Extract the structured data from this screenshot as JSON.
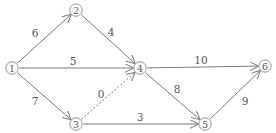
{
  "diagram": {
    "type": "directed-weighted-network",
    "nodes": [
      {
        "id": "1",
        "label": "1",
        "x": 12,
        "y": 68
      },
      {
        "id": "2",
        "label": "2",
        "x": 76,
        "y": 10
      },
      {
        "id": "3",
        "label": "3",
        "x": 76,
        "y": 124
      },
      {
        "id": "4",
        "label": "4",
        "x": 140,
        "y": 68
      },
      {
        "id": "5",
        "label": "5",
        "x": 205,
        "y": 124
      },
      {
        "id": "6",
        "label": "6",
        "x": 265,
        "y": 66
      }
    ],
    "edges": [
      {
        "from": "1",
        "to": "2",
        "weight": "6",
        "style": "solid",
        "label_x": 35,
        "label_y": 33
      },
      {
        "from": "1",
        "to": "4",
        "weight": "5",
        "style": "solid",
        "label_x": 73,
        "label_y": 61
      },
      {
        "from": "1",
        "to": "3",
        "weight": "7",
        "style": "solid",
        "label_x": 35,
        "label_y": 101
      },
      {
        "from": "2",
        "to": "4",
        "weight": "4",
        "style": "solid",
        "label_x": 111,
        "label_y": 32
      },
      {
        "from": "3",
        "to": "4",
        "weight": "0",
        "style": "dashed",
        "label_x": 101,
        "label_y": 94
      },
      {
        "from": "3",
        "to": "5",
        "weight": "3",
        "style": "solid",
        "label_x": 140,
        "label_y": 117
      },
      {
        "from": "4",
        "to": "6",
        "weight": "10",
        "style": "solid",
        "label_x": 201,
        "label_y": 60
      },
      {
        "from": "4",
        "to": "5",
        "weight": "8",
        "style": "solid",
        "label_x": 177,
        "label_y": 89
      },
      {
        "from": "5",
        "to": "6",
        "weight": "9",
        "style": "solid",
        "label_x": 245,
        "label_y": 101
      }
    ]
  }
}
